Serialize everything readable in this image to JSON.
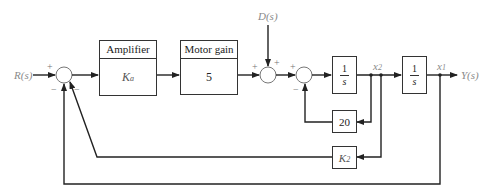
{
  "diagram": {
    "type": "block-diagram",
    "inputs": {
      "reference": "R(s)",
      "disturbance": "D(s)"
    },
    "output": "Y(s)",
    "blocks": [
      {
        "id": "amplifier",
        "header": "Amplifier",
        "gain": "K",
        "gain_sub": "a"
      },
      {
        "id": "motor",
        "header": "Motor gain",
        "gain": "5"
      },
      {
        "id": "integrator1",
        "num": "1",
        "den": "s"
      },
      {
        "id": "integrator2",
        "num": "1",
        "den": "s"
      },
      {
        "id": "velocity_fb",
        "gain": "20"
      },
      {
        "id": "k2_fb",
        "gain": "K",
        "gain_sub": "2"
      }
    ],
    "states": {
      "x2": "x",
      "x2_sub": "2",
      "x1": "x",
      "x1_sub": "1"
    },
    "signs": {
      "sum1_plus": "+",
      "sum1_minus_a": "−",
      "sum1_minus_b": "−",
      "sum2_plus_left": "+",
      "sum2_plus_top": "+",
      "sum3_plus": "+",
      "sum3_minus": "−"
    },
    "colors": {
      "line": "#222222",
      "label": "#8a8a8a"
    }
  }
}
